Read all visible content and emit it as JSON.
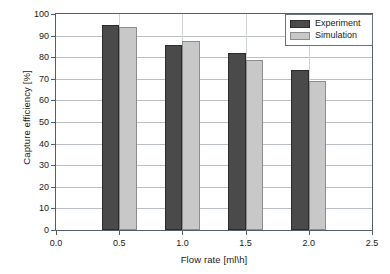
{
  "chart_data": {
    "type": "bar",
    "title": "",
    "subtitle": "",
    "xlabel": "Flow rate [ml\\h]",
    "ylabel": "Capture efficiency [%]",
    "x": [
      0.5,
      1.0,
      1.5,
      2.0
    ],
    "categories": [
      "0.5",
      "1.0",
      "1.5",
      "2.0"
    ],
    "series": [
      {
        "name": "Experiment",
        "color": "#4a4a4a",
        "values": [
          95.0,
          85.6,
          82.0,
          74.3
        ]
      },
      {
        "name": "Simulation",
        "color": "#c8c8c8",
        "values": [
          94.0,
          87.6,
          78.5,
          69.0
        ]
      }
    ],
    "xlim": [
      0.0,
      2.5
    ],
    "ylim": [
      0,
      100
    ],
    "xticks": [
      "0.0",
      "0.5",
      "1.0",
      "1.5",
      "2.0",
      "2.5"
    ],
    "xtick_values": [
      0.0,
      0.5,
      1.0,
      1.5,
      2.0,
      2.5
    ],
    "yticks": [
      "0",
      "10",
      "20",
      "30",
      "40",
      "50",
      "60",
      "70",
      "80",
      "90",
      "100"
    ],
    "ytick_values": [
      0,
      10,
      20,
      30,
      40,
      50,
      60,
      70,
      80,
      90,
      100
    ],
    "grid": true,
    "grid_axis": "y",
    "legend_position": "top-right",
    "bar_width": 0.14,
    "bar_gap": 0.0
  },
  "legend": {
    "entries": [
      {
        "label": "Experiment",
        "color": "#4a4a4a"
      },
      {
        "label": "Simulation",
        "color": "#c8c8c8"
      }
    ]
  },
  "colors": {
    "axis": "#555f66",
    "grid": "#b9bfc4",
    "background": "#ffffff",
    "experiment": "#4a4a4a",
    "simulation": "#c8c8c8"
  }
}
